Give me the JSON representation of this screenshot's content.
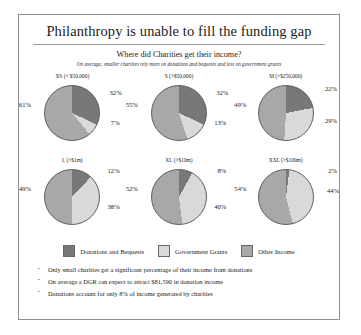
{
  "slide": {
    "title": "Philanthropy is unable to fill the funding gap",
    "subtitle": "Where did Charities get their income?",
    "note": "On average, smaller charities rely more on donations and bequests and less on government grants"
  },
  "colors": {
    "donations": "#787878",
    "government": "#d9d9d9",
    "other": "#a8a8a8",
    "outline": "#5d5d5d",
    "border": "#8f8f8f",
    "text": "#1b1b1b"
  },
  "legend": {
    "items": [
      {
        "label": "Donations and Bequests",
        "key": "donations",
        "color": "#787878"
      },
      {
        "label": "Government Grants",
        "key": "government",
        "color": "#d9d9d9"
      },
      {
        "label": "Other Income",
        "key": "other",
        "color": "#a8a8a8"
      }
    ]
  },
  "bullets": [
    "Only small charities get a significant percentage of their income from donations",
    "On average a DGR can expect to attract $81,590 in donation income",
    "Donations account for only 8% of income generated by charities"
  ],
  "chart_data": {
    "type": "pie",
    "title": "Where did Charities get their income?",
    "subtitle": "On average, smaller charities rely more on donations and bequests and less on government grants",
    "series_labels": [
      "Donations and Bequests",
      "Government Grants",
      "Other Income"
    ],
    "legend_position": "bottom",
    "units": "percent",
    "charts": [
      {
        "name": "XS",
        "label": "XS (< $50,000)",
        "slices": [
          {
            "name": "Donations and Bequests",
            "value": 32,
            "label": "32%"
          },
          {
            "name": "Government Grants",
            "value": 7,
            "label": "7%"
          },
          {
            "name": "Other Income",
            "value": 61,
            "label": "61%"
          }
        ]
      },
      {
        "name": "S",
        "label": "S (>$50,000)",
        "slices": [
          {
            "name": "Donations and Bequests",
            "value": 32,
            "label": "32%"
          },
          {
            "name": "Government Grants",
            "value": 13,
            "label": "13%"
          },
          {
            "name": "Other Income",
            "value": 55,
            "label": "55%"
          }
        ]
      },
      {
        "name": "M",
        "label": "M (>$250,000)",
        "slices": [
          {
            "name": "Donations and Bequests",
            "value": 22,
            "label": "22%"
          },
          {
            "name": "Government Grants",
            "value": 29,
            "label": "29%"
          },
          {
            "name": "Other Income",
            "value": 49,
            "label": "49%"
          }
        ]
      },
      {
        "name": "L",
        "label": "L (>$1m)",
        "slices": [
          {
            "name": "Donations and Bequests",
            "value": 12,
            "label": "12%"
          },
          {
            "name": "Government Grants",
            "value": 38,
            "label": "38%"
          },
          {
            "name": "Other Income",
            "value": 49,
            "label": "49%"
          }
        ]
      },
      {
        "name": "XL",
        "label": "XL (>$10m)",
        "slices": [
          {
            "name": "Donations and Bequests",
            "value": 8,
            "label": "8%"
          },
          {
            "name": "Government Grants",
            "value": 40,
            "label": "40%"
          },
          {
            "name": "Other Income",
            "value": 52,
            "label": "52%"
          }
        ]
      },
      {
        "name": "XXL",
        "label": "XXL (>$100m)",
        "slices": [
          {
            "name": "Donations and Bequests",
            "value": 2,
            "label": "2%"
          },
          {
            "name": "Government Grants",
            "value": 44,
            "label": "44%"
          },
          {
            "name": "Other Income",
            "value": 54,
            "label": "54%"
          }
        ]
      }
    ]
  }
}
